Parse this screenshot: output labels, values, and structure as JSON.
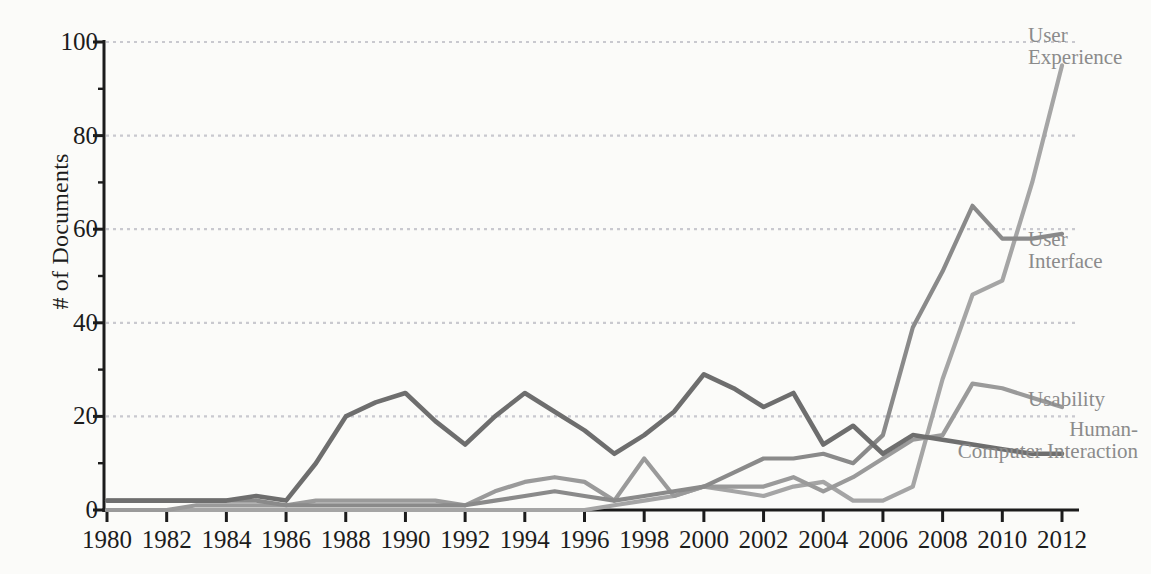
{
  "chart_data": {
    "type": "line",
    "title": "",
    "xlabel": "",
    "ylabel": "# of Documents",
    "xlim": [
      1980,
      2012
    ],
    "ylim": [
      0,
      100
    ],
    "grid": true,
    "grid_lines": [
      20,
      40,
      60,
      80,
      100
    ],
    "legend_position": "right-inline-labels",
    "x_tick_labels": [
      "1980",
      "1982",
      "1984",
      "1986",
      "1988",
      "1990",
      "1992",
      "1994",
      "1996",
      "1998",
      "2000",
      "2002",
      "2004",
      "2006",
      "2008",
      "2010",
      "2012"
    ],
    "y_tick_labels": [
      "0",
      "20",
      "40",
      "60",
      "80",
      "100"
    ],
    "x": [
      1980,
      1981,
      1982,
      1983,
      1984,
      1985,
      1986,
      1987,
      1988,
      1989,
      1990,
      1991,
      1992,
      1993,
      1994,
      1995,
      1996,
      1997,
      1998,
      1999,
      2000,
      2001,
      2002,
      2003,
      2004,
      2005,
      2006,
      2007,
      2008,
      2009,
      2010,
      2011,
      2012
    ],
    "series": [
      {
        "name": "Human-Computer Interaction",
        "color": "#6e6e6e",
        "label_lines": [
          "Human-",
          "Computer Interaction"
        ],
        "values": [
          2,
          2,
          2,
          2,
          2,
          3,
          2,
          10,
          20,
          23,
          25,
          19,
          14,
          20,
          25,
          21,
          17,
          12,
          16,
          21,
          29,
          26,
          22,
          25,
          14,
          18,
          12,
          16,
          15,
          14,
          13,
          12,
          12
        ]
      },
      {
        "name": "User Interface",
        "color": "#8a8a8a",
        "label_lines": [
          "User",
          "Interface"
        ],
        "values": [
          2,
          2,
          2,
          2,
          2,
          2,
          1,
          1,
          1,
          1,
          1,
          1,
          1,
          2,
          3,
          4,
          3,
          2,
          3,
          4,
          5,
          8,
          11,
          11,
          12,
          10,
          16,
          39,
          51,
          65,
          58,
          58,
          59
        ]
      },
      {
        "name": "Usability",
        "color": "#9a9a9a",
        "label_lines": [
          "Usability"
        ],
        "values": [
          0,
          0,
          0,
          1,
          1,
          1,
          1,
          2,
          2,
          2,
          2,
          2,
          1,
          4,
          6,
          7,
          6,
          2,
          11,
          3,
          5,
          5,
          5,
          7,
          4,
          7,
          11,
          15,
          16,
          27,
          26,
          24,
          22
        ]
      },
      {
        "name": "User Experience",
        "color": "#a5a5a5",
        "label_lines": [
          "User",
          "Experience"
        ],
        "values": [
          0,
          0,
          0,
          0,
          0,
          0,
          0,
          0,
          0,
          0,
          0,
          0,
          0,
          0,
          0,
          0,
          0,
          1,
          2,
          3,
          5,
          4,
          3,
          5,
          6,
          2,
          2,
          5,
          28,
          46,
          49,
          70,
          95
        ]
      }
    ],
    "axis_color": "#1c1c1c",
    "grid_color": "#c9c9cf",
    "background": "#fbfbf9"
  },
  "annotations": {
    "user_experience_label": "User\nExperience",
    "user_interface_label": "User\nInterface",
    "usability_label": "Usability",
    "hci_label": "Human-\nComputer Interaction"
  }
}
